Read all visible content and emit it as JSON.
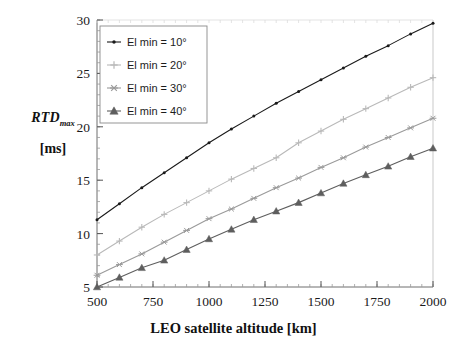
{
  "chart_data": {
    "type": "line",
    "title": "",
    "xlabel": "LEO satellite altitude [km]",
    "ylabel": "RTD_max [ms]",
    "ylabel_main": "RTD",
    "ylabel_sub": "max",
    "ylabel_unit": "[ms]",
    "xlim": [
      500,
      2000
    ],
    "ylim": [
      5,
      30
    ],
    "xticks": [
      500,
      750,
      1000,
      1250,
      1500,
      1750,
      2000
    ],
    "yticks": [
      5,
      10,
      15,
      20,
      25,
      30
    ],
    "x_minor_step": 50,
    "y_minor_step": 1,
    "grid": false,
    "legend_position": "upper-left",
    "x": [
      500,
      600,
      700,
      800,
      900,
      1000,
      1100,
      1200,
      1300,
      1400,
      1500,
      1600,
      1700,
      1800,
      1900,
      2000
    ],
    "series": [
      {
        "name": "El min = 10°",
        "marker": "dot",
        "color": "#1a1a1a",
        "values": [
          11.3,
          12.8,
          14.3,
          15.7,
          17.1,
          18.5,
          19.8,
          21.0,
          22.2,
          23.3,
          24.4,
          25.5,
          26.6,
          27.6,
          28.7,
          29.7
        ]
      },
      {
        "name": "El min = 20°",
        "marker": "plus",
        "color": "#b9b9b9",
        "values": [
          8.0,
          9.3,
          10.6,
          11.8,
          12.9,
          14.0,
          15.1,
          16.1,
          17.1,
          18.5,
          19.6,
          20.7,
          21.7,
          22.7,
          23.7,
          24.6
        ]
      },
      {
        "name": "El min = 30°",
        "marker": "asterisk",
        "color": "#9a9a9a",
        "values": [
          6.1,
          7.1,
          8.1,
          9.2,
          10.3,
          11.4,
          12.3,
          13.3,
          14.3,
          15.2,
          16.2,
          17.1,
          18.1,
          19.0,
          19.9,
          20.8
        ]
      },
      {
        "name": "El min = 40°",
        "marker": "triangle",
        "color": "#5e5e5e",
        "values": [
          5.0,
          5.9,
          6.8,
          7.5,
          8.5,
          9.5,
          10.4,
          11.3,
          12.1,
          12.9,
          13.8,
          14.7,
          15.5,
          16.3,
          17.2,
          18.0
        ]
      }
    ]
  },
  "legend": {
    "items": [
      {
        "label": "El min = 10°"
      },
      {
        "label": "El min = 20°"
      },
      {
        "label": "El min = 30°"
      },
      {
        "label": "El min = 40°"
      }
    ]
  },
  "axes": {
    "x_tick_labels": [
      "500",
      "750",
      "1000",
      "1250",
      "1500",
      "1750",
      "2000"
    ],
    "y_tick_labels": [
      "5",
      "10",
      "15",
      "20",
      "25",
      "30"
    ],
    "x_title": "LEO satellite altitude [km]",
    "y_title_main": "RTD",
    "y_title_sub": "max",
    "y_title_unit": "[ms]"
  },
  "colors": {
    "axis": "#6f6f6f",
    "text": "#1b1b1b",
    "series_10": "#1a1a1a",
    "series_20": "#b9b9b9",
    "series_30": "#9a9a9a",
    "series_40": "#5e5e5e",
    "legend_border": "#8a8a8a",
    "background": "#ffffff"
  }
}
